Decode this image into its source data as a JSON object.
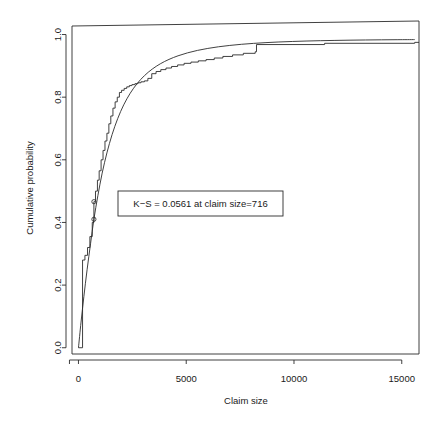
{
  "chart_data": {
    "type": "line",
    "title": "",
    "subtitle": "",
    "xlabel": "Claim size",
    "ylabel": "Cumulative probability",
    "xlim": [
      -300,
      15800
    ],
    "ylim": [
      -0.02,
      1.04
    ],
    "xticks": [
      0,
      5000,
      10000,
      15000
    ],
    "xtick_labels": [
      "0",
      "5000",
      "10000",
      "15000"
    ],
    "yticks": [
      0.0,
      0.2,
      0.4,
      0.6,
      0.8,
      1.0
    ],
    "ytick_labels": [
      "0.0",
      "0.2",
      "0.4",
      "0.6",
      "0.8",
      "1.0"
    ],
    "grid": false,
    "legend": "none",
    "annotations": [
      {
        "name": "ks-statistic-box",
        "text": "K−S = 0.0561 at claim size=716",
        "x": 716,
        "y": 0.44
      }
    ],
    "markers": [
      {
        "x": 716,
        "y": 0.4102
      },
      {
        "x": 716,
        "y": 0.4663
      }
    ],
    "series": [
      {
        "name": "Fitted cumulative distribution",
        "style": "smooth-curve",
        "x": [
          0,
          120,
          250,
          400,
          560,
          716,
          900,
          1100,
          1320,
          1560,
          1820,
          2100,
          2400,
          2720,
          3060,
          3420,
          3800,
          4200,
          4620,
          5060,
          5520,
          6000,
          6500,
          7020,
          7560,
          8120,
          8700,
          9300,
          9920,
          10560,
          11220,
          11900,
          12600,
          13320,
          14060,
          14820,
          15600
        ],
        "y": [
          0.0,
          0.082,
          0.163,
          0.249,
          0.332,
          0.4102,
          0.4855,
          0.5575,
          0.6222,
          0.6805,
          0.7315,
          0.7755,
          0.8125,
          0.8432,
          0.8686,
          0.8895,
          0.9066,
          0.9206,
          0.9321,
          0.9415,
          0.9493,
          0.9556,
          0.9609,
          0.9652,
          0.9688,
          0.9717,
          0.9742,
          0.9762,
          0.9778,
          0.9792,
          0.9803,
          0.9812,
          0.982,
          0.9826,
          0.9831,
          0.9835,
          0.9838
        ]
      },
      {
        "name": "Empirical cumulative distribution",
        "style": "step",
        "x": [
          0,
          190,
          300,
          420,
          530,
          640,
          716,
          790,
          880,
          960,
          1050,
          1140,
          1230,
          1320,
          1410,
          1500,
          1600,
          1700,
          1800,
          1900,
          2000,
          2120,
          2240,
          2360,
          2480,
          2620,
          2760,
          2900,
          3060,
          3220,
          3400,
          3600,
          3820,
          4060,
          4320,
          4600,
          4900,
          5220,
          5560,
          5920,
          6300,
          6700,
          7150,
          7650,
          8200,
          8260,
          11420,
          15600
        ],
        "y": [
          0.0,
          0.28,
          0.295,
          0.32,
          0.355,
          0.4,
          0.4663,
          0.5,
          0.535,
          0.565,
          0.6,
          0.63,
          0.66,
          0.685,
          0.715,
          0.74,
          0.765,
          0.785,
          0.8,
          0.815,
          0.822,
          0.828,
          0.833,
          0.837,
          0.84,
          0.843,
          0.846,
          0.849,
          0.852,
          0.86,
          0.875,
          0.882,
          0.888,
          0.893,
          0.898,
          0.903,
          0.908,
          0.912,
          0.916,
          0.92,
          0.925,
          0.93,
          0.935,
          0.94,
          0.945,
          0.968,
          0.972,
          0.975
        ]
      }
    ]
  }
}
